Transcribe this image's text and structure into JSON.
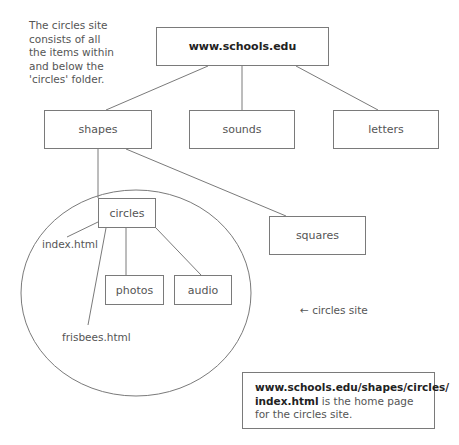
{
  "intro_text": "The circles site consists of all the items within and below the 'circles' folder.",
  "nodes": {
    "root": "www.schools.edu",
    "shapes": "shapes",
    "sounds": "sounds",
    "letters": "letters",
    "circles": "circles",
    "squares": "squares",
    "photos": "photos",
    "audio": "audio"
  },
  "files": {
    "index": "index.html",
    "frisbees": "frisbees.html"
  },
  "site_label": "← circles site",
  "note": {
    "url_bold": "www.schools.edu/shapes/circles/ index.html",
    "rest": " is the home page for the circles site."
  },
  "colors": {
    "line": "#7a7a7a",
    "text": "#555555",
    "bold_text": "#222222"
  }
}
